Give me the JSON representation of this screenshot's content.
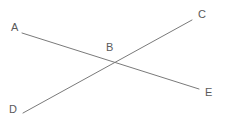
{
  "diagram": {
    "background_color": "#ffffff",
    "stroke_color": "#7a7a7a",
    "label_color": "#5a5a5a",
    "stroke_width": 1,
    "width": 225,
    "height": 124,
    "points": {
      "A": {
        "label": "A",
        "label_x": 11,
        "label_y": 22,
        "x": 22,
        "y": 33
      },
      "B": {
        "label": "B",
        "label_x": 106,
        "label_y": 42,
        "x": 112,
        "y": 61
      },
      "C": {
        "label": "C",
        "label_x": 198,
        "label_y": 9,
        "x": 192,
        "y": 20
      },
      "D": {
        "label": "D",
        "label_x": 9,
        "label_y": 104,
        "x": 23,
        "y": 113
      },
      "E": {
        "label": "E",
        "label_x": 205,
        "label_y": 87,
        "x": 199,
        "y": 89
      }
    },
    "segments": [
      {
        "name": "segment-AE",
        "from": "A",
        "to": "E",
        "x1": 22,
        "y1": 33,
        "x2": 199,
        "y2": 89
      },
      {
        "name": "segment-DC",
        "from": "D",
        "to": "C",
        "x1": 23,
        "y1": 113,
        "x2": 192,
        "y2": 20
      }
    ]
  }
}
